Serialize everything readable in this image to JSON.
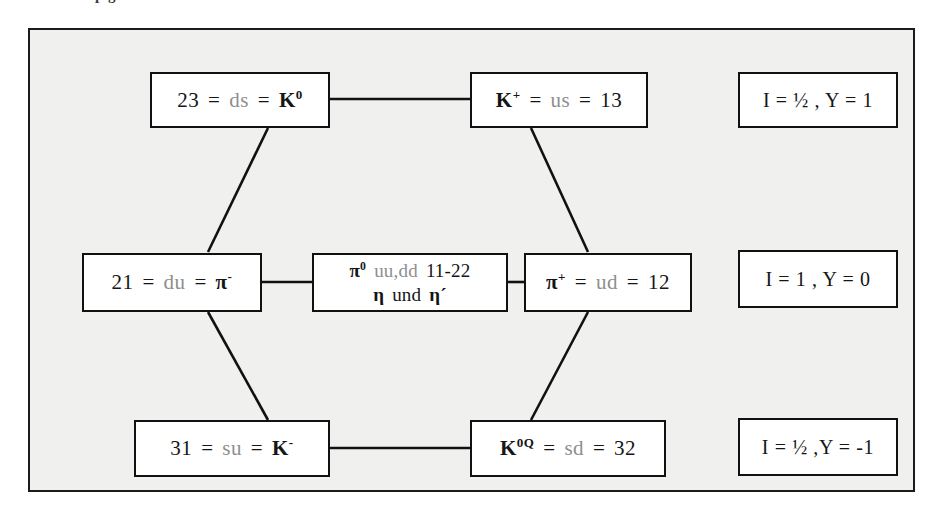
{
  "clipped_header": "p        g",
  "diagram": {
    "frame_color": "#1b1b1b",
    "background_color": "#f2f2f0",
    "box_border_color": "#111111",
    "line_color": "#111111",
    "nodes": [
      {
        "id": "k0",
        "quark_code_left": "23",
        "quark_content": "ds",
        "particle": "K",
        "particle_sup": "0",
        "full_text": "23 = ds = K⁰",
        "order": "code-first"
      },
      {
        "id": "kplus",
        "quark_code_right": "13",
        "quark_content": "us",
        "particle": "K",
        "particle_sup": "+",
        "full_text": "K⁺ = us = 13",
        "order": "particle-first"
      },
      {
        "id": "piminus",
        "quark_code_left": "21",
        "quark_content": "du",
        "particle": "π",
        "particle_sup": "-",
        "full_text": "21 = du = π⁻",
        "order": "code-first"
      },
      {
        "id": "center",
        "line1_particle": "π",
        "line1_sup": "0",
        "line1_quarks": "uu,dd",
        "line1_codes": "11-22",
        "line2_eta": "η",
        "line2_und": "und",
        "line2_etaprime": "η´",
        "full_text": "π⁰ uu,dd 11-22 / η und η´"
      },
      {
        "id": "piplus",
        "quark_code_right": "12",
        "quark_content": "ud",
        "particle": "π",
        "particle_sup": "+",
        "full_text": "π⁺ = ud = 12",
        "order": "particle-first"
      },
      {
        "id": "kminus",
        "quark_code_left": "31",
        "quark_content": "su",
        "particle": "K",
        "particle_sup": "-",
        "full_text": "31 = su = K⁻",
        "order": "code-first"
      },
      {
        "id": "k0bar",
        "quark_code_right": "32",
        "quark_content": "sd",
        "particle": "K",
        "particle_sup": "0Q",
        "full_text": "K⁰Q = sd = 32",
        "order": "particle-first"
      }
    ],
    "quantum_labels": [
      {
        "id": "row-top",
        "text": "I = ½ , Y = 1"
      },
      {
        "id": "row-middle",
        "text": "I = 1 , Y = 0"
      },
      {
        "id": "row-bottom",
        "text": "I = ½ ,Y = -1"
      }
    ],
    "symbols": {
      "equals": "=",
      "comma": ",",
      "half": "½"
    }
  }
}
